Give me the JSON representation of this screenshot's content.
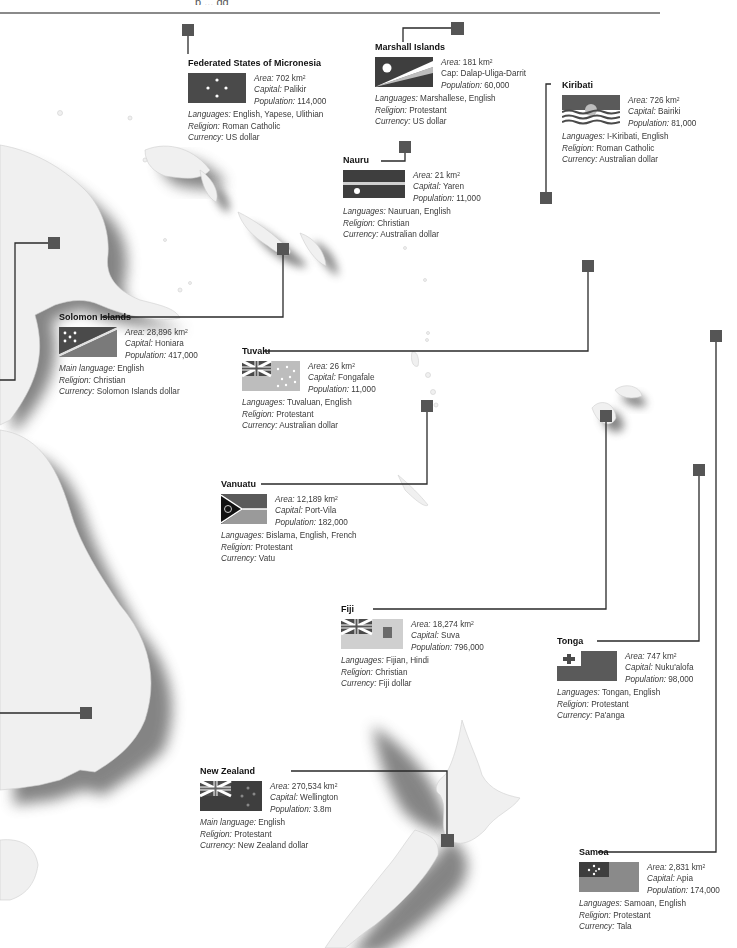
{
  "header": {
    "fragment": "p ... gg"
  },
  "labels": {
    "area": "Area:",
    "capital": "Capital:",
    "cap": "Cap:",
    "population": "Population:",
    "languages": "Languages:",
    "main_language": "Main language:",
    "religion": "Religion:",
    "currency": "Currency:",
    "km2_unit": "km",
    "km2_sup": "2"
  },
  "countries": {
    "micronesia": {
      "name": "Federated States of Micronesia",
      "area": "702",
      "capital": "Palikir",
      "population": "114,000",
      "languages": "English, Yapese, Ulithian",
      "religion": "Roman Catholic",
      "currency": "US dollar"
    },
    "marshall": {
      "name": "Marshall Islands",
      "area": "181",
      "capital": "Dalap-Uliga-Darrit",
      "population": "60,000",
      "languages": "Marshallese, English",
      "religion": "Protestant",
      "currency": "US dollar"
    },
    "kiribati": {
      "name": "Kiribati",
      "area": "726",
      "capital": "Bairiki",
      "population": "81,000",
      "languages": "I-Kiribati, English",
      "religion": "Roman Catholic",
      "currency": "Australian dollar"
    },
    "nauru": {
      "name": "Nauru",
      "area": "21",
      "capital": "Yaren",
      "population": "11,000",
      "languages": "Nauruan, English",
      "religion": "Christian",
      "currency": "Australian dollar"
    },
    "solomon": {
      "name": "Solomon Islands",
      "area": "28,896",
      "capital": "Honiara",
      "population": "417,000",
      "main_language": "English",
      "religion": "Christian",
      "currency": "Solomon Islands dollar"
    },
    "tuvalu": {
      "name": "Tuvalu",
      "area": "26",
      "capital": "Fongafale",
      "population": "11,000",
      "languages": "Tuvaluan, English",
      "religion": "Protestant",
      "currency": "Australian dollar"
    },
    "vanuatu": {
      "name": "Vanuatu",
      "area": "12,189",
      "capital": "Port-Vila",
      "population": "182,000",
      "languages": "Bislama, English, French",
      "religion": "Protestant",
      "currency": "Vatu"
    },
    "fiji": {
      "name": "Fiji",
      "area": "18,274",
      "capital": "Suva",
      "population": "796,000",
      "languages": "Fijian, Hindi",
      "religion": "Christian",
      "currency": "Fiji dollar"
    },
    "tonga": {
      "name": "Tonga",
      "area": "747",
      "capital": "Nuku'alofa",
      "population": "98,000",
      "languages": "Tongan, English",
      "religion": "Protestant",
      "currency": "Pa'anga"
    },
    "new_zealand": {
      "name": "New Zealand",
      "area": "270,534",
      "capital": "Wellington",
      "population": "3.8m",
      "main_language": "English",
      "religion": "Protestant",
      "currency": "New Zealand dollar"
    },
    "samoa": {
      "name": "Samoa",
      "area": "2,831",
      "capital": "Apia",
      "population": "174,000",
      "languages": "Samoan, English",
      "religion": "Protestant",
      "currency": "Tala"
    }
  },
  "colors": {
    "land": "#efefef",
    "land_shadow": "#7a7a7a",
    "marker": "#555555",
    "leader_line": "#222222",
    "flag_dark": "#4a4a4a",
    "flag_mid": "#7d7d7d",
    "flag_light": "#bdbdbd"
  }
}
